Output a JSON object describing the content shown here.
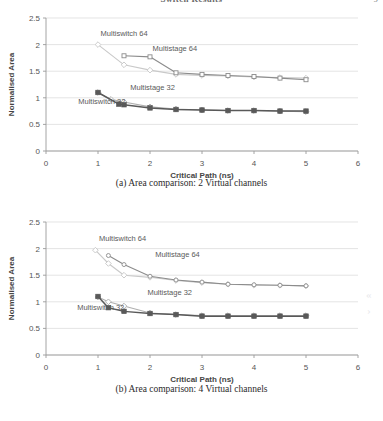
{
  "header": {
    "title": "Switch Results",
    "page_number": "9"
  },
  "figures": [
    {
      "id": "a",
      "caption": "(a) Area comparison: 2 Virtual channels",
      "chart_data": {
        "type": "line",
        "title": "",
        "xlabel": "Critical Path (ns)",
        "ylabel": "Normalised Area",
        "xlim": [
          0,
          6
        ],
        "ylim": [
          0,
          2.5
        ],
        "xticks": [
          "0",
          "1",
          "2",
          "3",
          "4",
          "5",
          "6"
        ],
        "yticks": [
          "0",
          "0.5",
          "1",
          "1.5",
          "2",
          "2.5"
        ],
        "grid": "horizontal",
        "legend": "inline-annotations",
        "annotations": [
          {
            "text": "Multiswitch 64",
            "x": 1.05,
            "y": 2.17
          },
          {
            "text": "Multistage 64",
            "x": 2.05,
            "y": 1.88
          },
          {
            "text": "Multistage 32",
            "x": 1.62,
            "y": 1.14
          },
          {
            "text": "Multiswitch 32",
            "x": 0.62,
            "y": 0.88
          }
        ],
        "series": [
          {
            "name": "Multiswitch 64",
            "color": "#c9c9c9",
            "marker": "diamond-open",
            "x": [
              1.0,
              1.5,
              2.0,
              2.5,
              3.0,
              3.5,
              4.0,
              4.5,
              5.0
            ],
            "y": [
              2.0,
              1.62,
              1.52,
              1.44,
              1.42,
              1.41,
              1.39,
              1.38,
              1.37
            ]
          },
          {
            "name": "Multistage 64",
            "color": "#8c8c8c",
            "marker": "square-open",
            "x": [
              1.5,
              2.0,
              2.5,
              3.0,
              3.5,
              4.0,
              4.5,
              5.0
            ],
            "y": [
              1.79,
              1.77,
              1.47,
              1.44,
              1.42,
              1.4,
              1.37,
              1.34
            ]
          },
          {
            "name": "Multistage 32",
            "color": "#b0b0b0",
            "marker": "diamond-open",
            "x": [
              1.0,
              1.25,
              1.5,
              2.0,
              2.5,
              3.0,
              3.5,
              4.0,
              4.5,
              5.0
            ],
            "y": [
              1.1,
              0.97,
              0.92,
              0.83,
              0.79,
              0.77,
              0.76,
              0.76,
              0.75,
              0.74
            ]
          },
          {
            "name": "Multiswitch 32",
            "color": "#595959",
            "marker": "square-filled",
            "x": [
              1.0,
              1.4,
              1.5,
              2.0,
              2.5,
              3.0,
              3.5,
              4.0,
              4.5,
              5.0
            ],
            "y": [
              1.1,
              0.88,
              0.87,
              0.81,
              0.78,
              0.77,
              0.76,
              0.76,
              0.75,
              0.75
            ]
          }
        ]
      }
    },
    {
      "id": "b",
      "caption": "(b) Area comparison: 4 Virtual channels",
      "chart_data": {
        "type": "line",
        "title": "",
        "xlabel": "Critical Path (ns)",
        "ylabel": "Normalised Area",
        "xlim": [
          0,
          6
        ],
        "ylim": [
          0,
          2.5
        ],
        "xticks": [
          "0",
          "1",
          "2",
          "3",
          "4",
          "5",
          "6"
        ],
        "yticks": [
          "0",
          "0.5",
          "1",
          "1.5",
          "2",
          "2.5"
        ],
        "grid": "horizontal",
        "legend": "inline-annotations",
        "annotations": [
          {
            "text": "Multiswitch 64",
            "x": 1.02,
            "y": 2.15
          },
          {
            "text": "Multistage 64",
            "x": 2.1,
            "y": 1.85
          },
          {
            "text": "Multistage 32",
            "x": 1.95,
            "y": 1.12
          },
          {
            "text": "Multiswitch 32",
            "x": 0.6,
            "y": 0.85
          }
        ],
        "series": [
          {
            "name": "Multiswitch 64",
            "color": "#c9c9c9",
            "marker": "diamond-open",
            "x": [
              0.95,
              1.2,
              1.5,
              2.0,
              2.5,
              3.0,
              3.5,
              4.0,
              4.5,
              5.0
            ],
            "y": [
              1.97,
              1.72,
              1.5,
              1.46,
              1.4,
              1.36,
              1.33,
              1.31,
              1.31,
              1.3
            ]
          },
          {
            "name": "Multistage 64",
            "color": "#8c8c8c",
            "marker": "circle-open",
            "x": [
              1.2,
              1.5,
              2.0,
              2.5,
              3.0,
              3.5,
              4.0,
              4.5,
              5.0
            ],
            "y": [
              1.87,
              1.7,
              1.48,
              1.41,
              1.37,
              1.33,
              1.32,
              1.31,
              1.3
            ]
          },
          {
            "name": "Multistage 32",
            "color": "#b0b0b0",
            "marker": "diamond-open",
            "x": [
              1.0,
              1.2,
              1.5,
              2.0,
              2.5,
              3.0,
              3.5,
              4.0,
              4.5,
              5.0
            ],
            "y": [
              1.09,
              1.0,
              0.92,
              0.79,
              0.76,
              0.74,
              0.74,
              0.74,
              0.74,
              0.74
            ]
          },
          {
            "name": "Multiswitch 32",
            "color": "#595959",
            "marker": "square-filled",
            "x": [
              1.0,
              1.2,
              1.5,
              2.0,
              2.5,
              3.0,
              3.5,
              4.0,
              4.5,
              5.0
            ],
            "y": [
              1.1,
              0.89,
              0.82,
              0.78,
              0.76,
              0.73,
              0.73,
              0.73,
              0.73,
              0.73
            ]
          }
        ]
      }
    }
  ],
  "artifacts": [
    {
      "glyph": "«",
      "x": 366,
      "y": 288
    },
    {
      "glyph": "›",
      "x": 367,
      "y": 304
    }
  ]
}
